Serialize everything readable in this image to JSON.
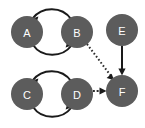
{
  "figure": {
    "background_color": "#ffffff",
    "node_color": "#5c5c5c",
    "node_label_color": "#ffffff",
    "edge_color": "#1a1a1a",
    "width": 145,
    "height": 128
  },
  "nodes": [
    {
      "id": "A",
      "label": "A",
      "cx": 27,
      "cy": 32,
      "r": 16
    },
    {
      "id": "B",
      "label": "B",
      "cx": 77,
      "cy": 32,
      "r": 16
    },
    {
      "id": "C",
      "label": "C",
      "cx": 27,
      "cy": 94,
      "r": 16
    },
    {
      "id": "D",
      "label": "D",
      "cx": 77,
      "cy": 94,
      "r": 16
    },
    {
      "id": "E",
      "label": "E",
      "cx": 122,
      "cy": 30,
      "r": 16
    },
    {
      "id": "F",
      "label": "F",
      "cx": 122,
      "cy": 91,
      "r": 16
    }
  ],
  "edges": [
    {
      "id": "B-A",
      "from": "B",
      "to": "A",
      "style": "solid",
      "shape": "curved-top",
      "directed": true
    },
    {
      "id": "A-B",
      "from": "A",
      "to": "B",
      "style": "solid",
      "shape": "curved-bottom",
      "directed": true
    },
    {
      "id": "D-C",
      "from": "D",
      "to": "C",
      "style": "solid",
      "shape": "curved-top",
      "directed": true
    },
    {
      "id": "C-D",
      "from": "C",
      "to": "D",
      "style": "solid",
      "shape": "curved-bottom",
      "directed": true
    },
    {
      "id": "E-F",
      "from": "E",
      "to": "F",
      "style": "solid",
      "shape": "straight-vertical",
      "directed": true
    },
    {
      "id": "B-F",
      "from": "B",
      "to": "F",
      "style": "dotted",
      "shape": "straight-diagonal",
      "directed": true
    },
    {
      "id": "D-F",
      "from": "D",
      "to": "F",
      "style": "dotted",
      "shape": "straight-horizontal",
      "directed": true
    }
  ]
}
